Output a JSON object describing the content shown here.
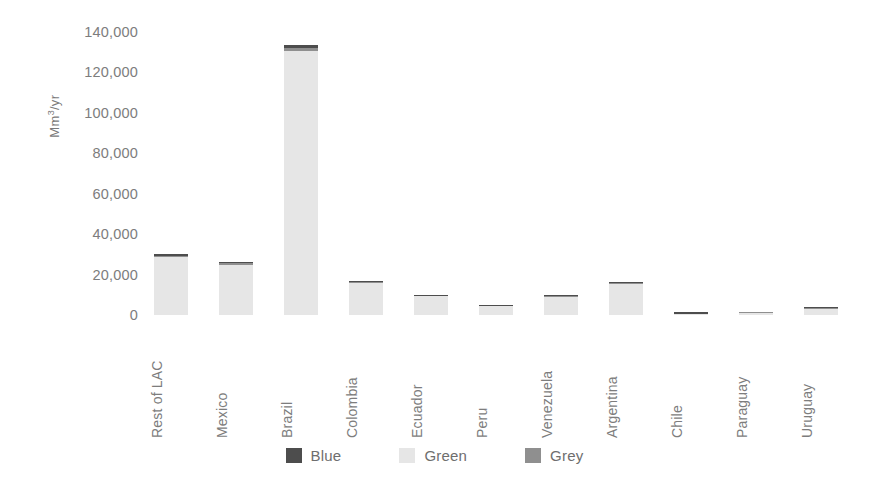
{
  "chart_data": {
    "type": "bar",
    "stacked": true,
    "title": "",
    "subtitle": "",
    "xlabel": "",
    "ylabel": "Mm3/yr",
    "ylabel_display": "Mm³/yr",
    "ylim": [
      0,
      140000
    ],
    "ytick_values": [
      0,
      20000,
      40000,
      60000,
      80000,
      100000,
      120000,
      140000
    ],
    "ytick_labels": [
      "0",
      "20,000",
      "40,000",
      "60,000",
      "80,000",
      "100,000",
      "120,000",
      "140,000"
    ],
    "grid": false,
    "legend_position": "bottom",
    "categories": [
      "Rest of LAC",
      "Mexico",
      "Brazil",
      "Colombia",
      "Ecuador",
      "Peru",
      "Venezuela",
      "Argentina",
      "Chile",
      "Paraguay",
      "Uruguay"
    ],
    "series": [
      {
        "name": "Green",
        "color": "#e6e6e6",
        "values": [
          28500,
          24800,
          130500,
          15900,
          9200,
          4300,
          9100,
          15200,
          300,
          900,
          2900
        ]
      },
      {
        "name": "Grey",
        "color": "#8f8f8f",
        "values": [
          900,
          700,
          1600,
          500,
          350,
          250,
          450,
          600,
          250,
          350,
          500
        ]
      },
      {
        "name": "Blue",
        "color": "#4d4d4d",
        "values": [
          700,
          500,
          1400,
          400,
          300,
          200,
          350,
          450,
          900,
          450,
          400
        ]
      }
    ],
    "totals": [
      30100,
      26000,
      133500,
      16800,
      9850,
      4750,
      9900,
      16250,
      1450,
      1700,
      3800
    ]
  },
  "legend": {
    "items": [
      {
        "label": "Blue",
        "color": "#4d4d4d"
      },
      {
        "label": "Green",
        "color": "#e6e6e6"
      },
      {
        "label": "Grey",
        "color": "#8f8f8f"
      }
    ]
  },
  "colors": {
    "background": "#ffffff",
    "text": "#7d7d7d",
    "blue": "#4d4d4d",
    "green": "#e6e6e6",
    "grey": "#8f8f8f"
  }
}
